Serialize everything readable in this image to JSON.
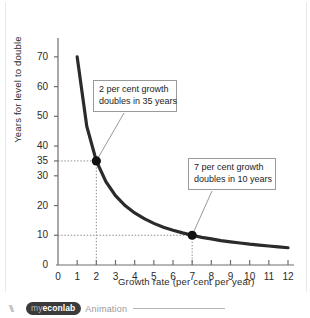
{
  "chart_data": {
    "type": "line",
    "title": "",
    "xlabel": "Growth rate (per cent per year)",
    "ylabel": "Years for level to double",
    "xlim": [
      0,
      12
    ],
    "ylim": [
      0,
      75
    ],
    "grid": false,
    "legend": "none",
    "curve_description": "Rule of 70: years to double = 70 / growth rate",
    "x": [
      1,
      1.5,
      2,
      2.5,
      3,
      3.5,
      4,
      4.5,
      5,
      5.5,
      6,
      6.5,
      7,
      7.5,
      8,
      8.5,
      9,
      9.5,
      10,
      10.5,
      11,
      11.5,
      12
    ],
    "y": [
      70,
      46.7,
      35,
      28,
      23.3,
      20,
      17.5,
      15.6,
      14,
      12.7,
      11.7,
      10.8,
      10,
      9.3,
      8.8,
      8.2,
      7.8,
      7.4,
      7,
      6.7,
      6.4,
      6.1,
      5.8
    ],
    "xticks": [
      0,
      1,
      2,
      3,
      4,
      5,
      6,
      7,
      8,
      9,
      10,
      11,
      12
    ],
    "xticklabels": [
      "0",
      "1",
      "2",
      "3",
      "4",
      "5",
      "6",
      "7",
      "8",
      "9",
      "10",
      "11",
      "12"
    ],
    "yticks": [
      0,
      10,
      20,
      30,
      35,
      40,
      50,
      60,
      70
    ],
    "yticklabels": [
      "0",
      "10",
      "20",
      "30",
      "35",
      "40",
      "50",
      "60",
      "70"
    ],
    "markers": [
      {
        "name": "point-2-percent",
        "x": 2,
        "y": 35
      },
      {
        "name": "point-7-percent",
        "x": 7,
        "y": 10
      }
    ],
    "dropline_pairs": [
      {
        "x": 2,
        "y": 35
      },
      {
        "x": 7,
        "y": 10
      }
    ],
    "annotations": [
      {
        "name": "annotation-2-percent",
        "line1": "2 per cent growth",
        "line2": "doubles in 35 years",
        "points_to": {
          "x": 2,
          "y": 35
        }
      },
      {
        "name": "annotation-7-percent",
        "line1": "7 per cent growth",
        "line2": "doubles in 10 years",
        "points_to": {
          "x": 7,
          "y": 10
        }
      }
    ],
    "colors": {
      "curve": "#2b2b2b",
      "axis": "#6e6e6e",
      "dropline": "#8a8a8a",
      "marker": "#111111",
      "text": "#2b2b2b",
      "callout_border": "#9a9a9a",
      "leader": "#9a9a9a"
    }
  },
  "footer": {
    "brand_prefix": "my",
    "brand_name": "econlab",
    "caption": "Animation"
  }
}
